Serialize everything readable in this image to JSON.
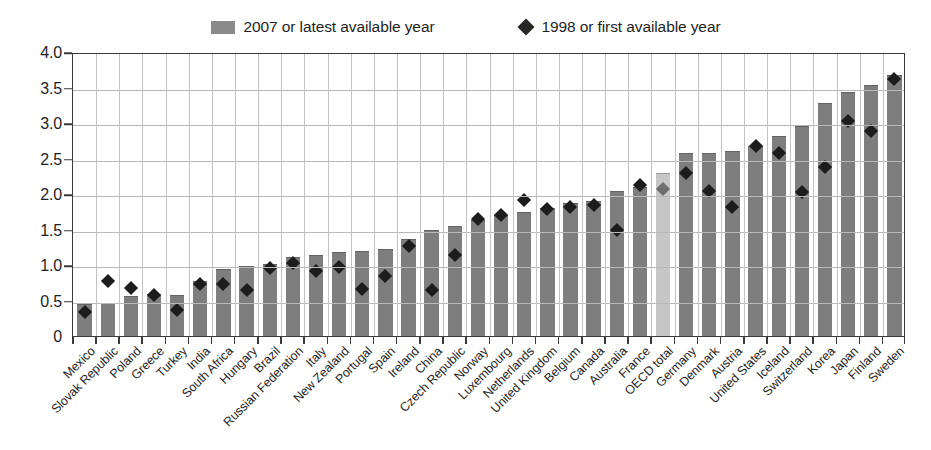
{
  "legend": {
    "entries": [
      {
        "label": "2007 or latest available year",
        "marker": "bar-swatch-icon",
        "color": "#8a8a8a"
      },
      {
        "label": "1998 or first available year",
        "marker": "diamond-icon",
        "color": "#262626"
      }
    ]
  },
  "colors": {
    "bar": "#7e7e7e",
    "bar_highlight": "#c6c6c6",
    "diamond": "#1c1c1c",
    "diamond_highlight": "#6e6e6e",
    "grid": "#bdbdbd",
    "axis": "#3a3a3a"
  },
  "chart_data": {
    "type": "bar",
    "title": "",
    "xlabel": "",
    "ylabel": "",
    "ylim": [
      0,
      4.0
    ],
    "yticks": [
      "0",
      "0.5",
      "1.0",
      "1.5",
      "2.0",
      "2.5",
      "3.0",
      "3.5",
      "4.0"
    ],
    "ytick_values": [
      0,
      0.5,
      1.0,
      1.5,
      2.0,
      2.5,
      3.0,
      3.5,
      4.0
    ],
    "grid": true,
    "legend_position": "top-center",
    "highlight_category": "OECD total",
    "categories": [
      "Mexico",
      "Slovak Republic",
      "Poland",
      "Greece",
      "Turkey",
      "India",
      "South Africa",
      "Hungary",
      "Brazil",
      "Russian Federation",
      "Italy",
      "New Zealand",
      "Portugal",
      "Spain",
      "Ireland",
      "China",
      "Czech Republic",
      "Norway",
      "Luxembourg",
      "Netherlands",
      "United Kingdom",
      "Belgium",
      "Canada",
      "Australia",
      "France",
      "OECD total",
      "Germany",
      "Denmark",
      "Austria",
      "United States",
      "Iceland",
      "Switzerland",
      "Korea",
      "Japan",
      "Finland",
      "Sweden"
    ],
    "series": [
      {
        "name": "2007 or latest available year",
        "type": "bar",
        "values": [
          0.45,
          0.47,
          0.56,
          0.59,
          0.58,
          0.78,
          0.95,
          0.98,
          1.02,
          1.11,
          1.14,
          1.18,
          1.2,
          1.23,
          1.37,
          1.49,
          1.55,
          1.63,
          1.7,
          1.75,
          1.8,
          1.87,
          1.9,
          2.04,
          2.1,
          2.3,
          2.58,
          2.58,
          2.61,
          2.68,
          2.82,
          2.96,
          3.28,
          3.44,
          3.53,
          3.68
        ]
      },
      {
        "name": "1998 or first available year",
        "type": "scatter",
        "values": [
          0.37,
          0.8,
          0.7,
          0.61,
          0.4,
          0.76,
          0.76,
          0.68,
          0.99,
          1.05,
          0.95,
          1.0,
          0.69,
          0.87,
          1.3,
          0.68,
          1.17,
          1.68,
          1.73,
          1.95,
          1.81,
          1.85,
          1.88,
          1.52,
          2.15,
          2.1,
          2.32,
          2.07,
          1.85,
          2.7,
          2.6,
          2.05,
          2.41,
          3.05,
          2.92,
          3.65
        ]
      }
    ]
  }
}
